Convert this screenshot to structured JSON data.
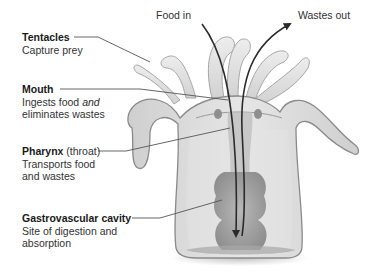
{
  "diagram": {
    "flow_labels": {
      "food_in": "Food in",
      "wastes_out": "Wastes out"
    },
    "labels": [
      {
        "id": "tentacles",
        "title": "Tentacles",
        "desc_line1": "Capture prey",
        "desc_line2": ""
      },
      {
        "id": "mouth",
        "title": "Mouth",
        "desc_line1_pre": "Ingests food ",
        "desc_line1_em": "and",
        "desc_line2": "eliminates wastes"
      },
      {
        "id": "pharynx",
        "title": "Pharynx",
        "title_suffix": " (throat)",
        "desc_line1": "Transports food",
        "desc_line2": "and wastes"
      },
      {
        "id": "gastrovascular-cavity",
        "title": "Gastrovascular cavity",
        "desc_line1": "Site of digestion and",
        "desc_line2": "absorption"
      }
    ],
    "colors": {
      "body_fill": "#dcdcdc",
      "body_stroke": "#8a8a8a",
      "cavity_fill": "#9a9a9a",
      "arrow": "#2b2b2b",
      "leader": "#555555"
    }
  }
}
